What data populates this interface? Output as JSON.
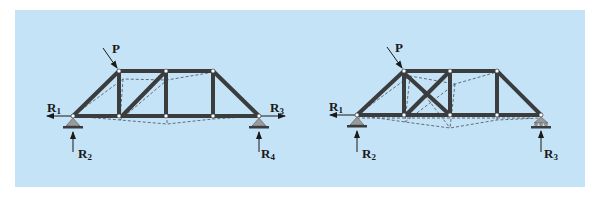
{
  "figure": {
    "background_color": "#c4e3f6",
    "member_color": "#3a3c3e",
    "deflected_line_color": "#4a4e55",
    "support_color": "#9a9a9a"
  },
  "left_truss": {
    "description": "Statically indeterminate truss with pin supports at both ends (externally indeterminate)",
    "load_label": "P",
    "reactions": {
      "r1": {
        "letter": "R",
        "sub": "1"
      },
      "r2": {
        "letter": "R",
        "sub": "2"
      },
      "r3": {
        "letter": "R",
        "sub": "3"
      },
      "r4": {
        "letter": "R",
        "sub": "4"
      }
    }
  },
  "right_truss": {
    "description": "Statically indeterminate truss with redundant diagonal member (internally indeterminate), pin and roller supports",
    "load_label": "P",
    "reactions": {
      "r1": {
        "letter": "R",
        "sub": "1"
      },
      "r2": {
        "letter": "R",
        "sub": "2"
      },
      "r3": {
        "letter": "R",
        "sub": "3"
      }
    }
  }
}
